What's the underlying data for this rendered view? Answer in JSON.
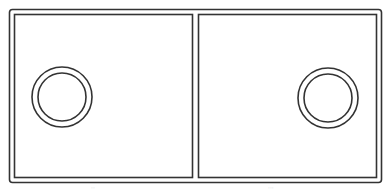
{
  "diagram": {
    "stroke_color": "#333333",
    "background": "#ffffff",
    "frame": {
      "x": 9.5,
      "y": 9.5,
      "w": 372,
      "h": 173,
      "rx": 3
    },
    "panels": [
      {
        "name": "left-panel",
        "x": 14.5,
        "y": 14.5,
        "w": 178,
        "h": 163,
        "ring": {
          "cx": 62,
          "cy": 97,
          "r_outer": 30,
          "r_inner": 24
        }
      },
      {
        "name": "right-panel",
        "x": 198.5,
        "y": 14.5,
        "w": 178,
        "h": 163,
        "ring": {
          "cx": 328,
          "cy": 98,
          "r_outer": 30,
          "r_inner": 24
        }
      }
    ],
    "labels": [
      {
        "text": "··",
        "x": 91,
        "y": 184
      },
      {
        "text": "···",
        "x": 268,
        "y": 184
      }
    ]
  }
}
